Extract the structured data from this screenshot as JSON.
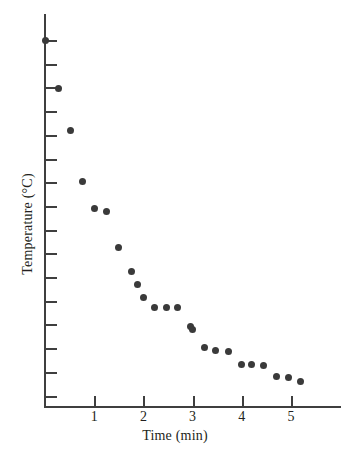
{
  "chart_data": {
    "type": "scatter",
    "title": "",
    "xlabel": "Time (min)",
    "ylabel": "Temperature (°C)",
    "xlim": [
      0,
      6.0
    ],
    "ylim_note": "Temperature axis is unlabeled; only evenly spaced tick marks are drawn (no numeric tick labels).",
    "grid": false,
    "legend": null,
    "x_tick_labels": [
      "1",
      "2",
      "3",
      "4",
      "5"
    ],
    "x_tick_values": [
      1,
      2,
      3,
      4,
      5
    ],
    "y_tick_labels": [],
    "y_tick_count": 16,
    "marker": {
      "shape": "circle",
      "color": "#3a3a3a",
      "size_px": 7
    },
    "axis_color": "#3f3f3f",
    "points": [
      {
        "x": 0.0,
        "y": 15.45
      },
      {
        "x": 0.28,
        "y": 13.42
      },
      {
        "x": 0.51,
        "y": 11.65
      },
      {
        "x": 0.77,
        "y": 9.46
      },
      {
        "x": 1.0,
        "y": 8.32
      },
      {
        "x": 1.24,
        "y": 8.23
      },
      {
        "x": 1.5,
        "y": 6.71
      },
      {
        "x": 1.75,
        "y": 5.7
      },
      {
        "x": 1.88,
        "y": 5.15
      },
      {
        "x": 2.0,
        "y": 4.6
      },
      {
        "x": 2.22,
        "y": 4.18
      },
      {
        "x": 2.46,
        "y": 4.18
      },
      {
        "x": 2.7,
        "y": 4.18
      },
      {
        "x": 2.95,
        "y": 3.38
      },
      {
        "x": 3.0,
        "y": 3.25
      },
      {
        "x": 3.25,
        "y": 2.49
      },
      {
        "x": 3.46,
        "y": 2.36
      },
      {
        "x": 3.72,
        "y": 2.32
      },
      {
        "x": 4.0,
        "y": 1.77
      },
      {
        "x": 4.2,
        "y": 1.77
      },
      {
        "x": 4.45,
        "y": 1.73
      },
      {
        "x": 4.7,
        "y": 1.27
      },
      {
        "x": 4.94,
        "y": 1.23
      },
      {
        "x": 5.2,
        "y": 1.02
      }
    ],
    "series_description": "Temperature of a cooling sample measured over time; values fall steeply at first then level off."
  },
  "axes": {
    "x_title": "Time (min)",
    "y_title": "Temperature (°C)"
  },
  "x_ticks": [
    {
      "label": "1",
      "value": 1
    },
    {
      "label": "2",
      "value": 2
    },
    {
      "label": "3",
      "value": 3
    },
    {
      "label": "4",
      "value": 4
    },
    {
      "label": "5",
      "value": 5
    }
  ]
}
